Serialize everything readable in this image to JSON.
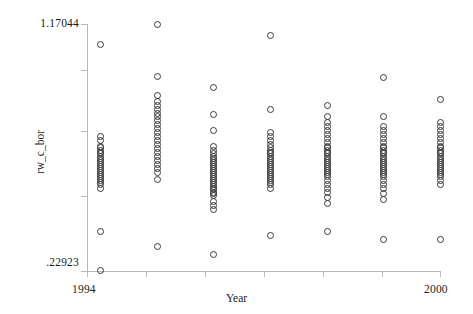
{
  "chart_data": {
    "type": "scatter",
    "title": "",
    "xlabel": "Year",
    "ylabel": "rw_c_bor",
    "grid": false,
    "legend": null,
    "xlim": [
      1994,
      2000
    ],
    "ylim": [
      0.22923,
      1.17044
    ],
    "x_tick_labels": [
      "1994",
      "2000"
    ],
    "y_tick_labels": [
      "1.17044",
      ".22923"
    ],
    "x_ticks": [
      1994,
      1995,
      1996,
      1997,
      1998,
      1999,
      2000
    ],
    "y_ticks": [
      0.22923,
      1.17044
    ],
    "categories": [
      1994,
      1995,
      1996,
      1997,
      1998,
      1999,
      2000
    ],
    "series": [
      {
        "name": "rw_c_bor",
        "x": [
          1994,
          1994,
          1994,
          1994,
          1994,
          1994,
          1994,
          1994,
          1994,
          1994,
          1994,
          1994,
          1994,
          1994,
          1994,
          1994,
          1994,
          1994,
          1994,
          1994,
          1994,
          1994,
          1994,
          1994,
          1994,
          1994,
          1995,
          1995,
          1995,
          1995,
          1995,
          1995,
          1995,
          1995,
          1995,
          1995,
          1995,
          1995,
          1995,
          1995,
          1995,
          1995,
          1995,
          1995,
          1995,
          1995,
          1995,
          1995,
          1995,
          1995,
          1996,
          1996,
          1996,
          1996,
          1996,
          1996,
          1996,
          1996,
          1996,
          1996,
          1996,
          1996,
          1996,
          1996,
          1996,
          1996,
          1996,
          1996,
          1996,
          1996,
          1996,
          1996,
          1996,
          1996,
          1996,
          1996,
          1996,
          1996,
          1996,
          1996,
          1996,
          1997,
          1997,
          1997,
          1997,
          1997,
          1997,
          1997,
          1997,
          1997,
          1997,
          1997,
          1997,
          1997,
          1997,
          1997,
          1997,
          1997,
          1997,
          1997,
          1997,
          1997,
          1997,
          1997,
          1997,
          1997,
          1997,
          1997,
          1998,
          1998,
          1998,
          1998,
          1998,
          1998,
          1998,
          1998,
          1998,
          1998,
          1998,
          1998,
          1998,
          1998,
          1998,
          1998,
          1998,
          1998,
          1998,
          1998,
          1998,
          1998,
          1998,
          1998,
          1998,
          1998,
          1998,
          1998,
          1998,
          1998,
          1998,
          1999,
          1999,
          1999,
          1999,
          1999,
          1999,
          1999,
          1999,
          1999,
          1999,
          1999,
          1999,
          1999,
          1999,
          1999,
          1999,
          1999,
          1999,
          1999,
          1999,
          1999,
          1999,
          1999,
          1999,
          1999,
          1999,
          1999,
          1999,
          1999,
          2000,
          2000,
          2000,
          2000,
          2000,
          2000,
          2000,
          2000,
          2000,
          2000,
          2000,
          2000,
          2000,
          2000,
          2000,
          2000,
          2000,
          2000,
          2000,
          2000,
          2000,
          2000,
          2000,
          2000,
          2000,
          2000
        ],
        "y": [
          1.093,
          0.745,
          0.728,
          0.707,
          0.7,
          0.692,
          0.684,
          0.677,
          0.669,
          0.661,
          0.654,
          0.646,
          0.638,
          0.631,
          0.623,
          0.615,
          0.608,
          0.6,
          0.592,
          0.585,
          0.577,
          0.57,
          0.562,
          0.547,
          0.383,
          0.233,
          1.17,
          0.973,
          0.9,
          0.878,
          0.863,
          0.848,
          0.833,
          0.818,
          0.803,
          0.788,
          0.773,
          0.758,
          0.743,
          0.728,
          0.713,
          0.698,
          0.683,
          0.668,
          0.653,
          0.638,
          0.623,
          0.608,
          0.578,
          0.323,
          0.93,
          0.826,
          0.767,
          0.707,
          0.692,
          0.677,
          0.669,
          0.661,
          0.654,
          0.646,
          0.638,
          0.631,
          0.623,
          0.615,
          0.608,
          0.6,
          0.592,
          0.585,
          0.577,
          0.57,
          0.562,
          0.555,
          0.547,
          0.54,
          0.532,
          0.525,
          0.517,
          0.495,
          0.48,
          0.465,
          0.293,
          1.13,
          0.848,
          0.76,
          0.745,
          0.73,
          0.715,
          0.7,
          0.692,
          0.684,
          0.677,
          0.669,
          0.661,
          0.654,
          0.646,
          0.638,
          0.631,
          0.623,
          0.615,
          0.608,
          0.6,
          0.592,
          0.585,
          0.577,
          0.57,
          0.562,
          0.547,
          0.368,
          0.863,
          0.818,
          0.796,
          0.781,
          0.766,
          0.751,
          0.736,
          0.721,
          0.707,
          0.7,
          0.692,
          0.684,
          0.677,
          0.669,
          0.661,
          0.654,
          0.646,
          0.638,
          0.631,
          0.623,
          0.615,
          0.608,
          0.6,
          0.592,
          0.577,
          0.562,
          0.547,
          0.532,
          0.51,
          0.488,
          0.383,
          0.968,
          0.818,
          0.781,
          0.766,
          0.751,
          0.736,
          0.721,
          0.707,
          0.7,
          0.692,
          0.684,
          0.677,
          0.669,
          0.661,
          0.654,
          0.646,
          0.638,
          0.631,
          0.623,
          0.615,
          0.608,
          0.6,
          0.592,
          0.577,
          0.562,
          0.547,
          0.525,
          0.503,
          0.353,
          0.885,
          0.796,
          0.781,
          0.766,
          0.751,
          0.736,
          0.721,
          0.707,
          0.7,
          0.692,
          0.684,
          0.677,
          0.669,
          0.661,
          0.654,
          0.646,
          0.638,
          0.631,
          0.623,
          0.615,
          0.608,
          0.6,
          0.592,
          0.577,
          0.562,
          0.353
        ]
      }
    ],
    "marker": {
      "shape": "open-circle",
      "color": "#3a3a3a",
      "size": 5
    },
    "axis_color": "#b9b9b9",
    "background": "#ffffff"
  },
  "axes": {
    "y_label_top": "1.17044",
    "y_label_bottom": ".22923",
    "y_title": "rw_c_bor",
    "x_label_left": "1994",
    "x_label_right": "2000",
    "x_title": "Year"
  }
}
